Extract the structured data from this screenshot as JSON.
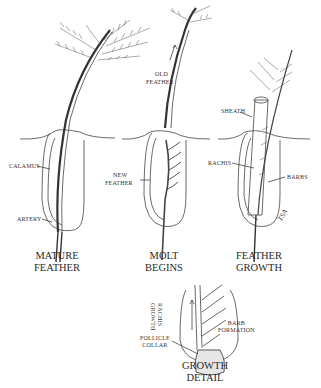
{
  "diagram": {
    "stages": [
      {
        "caption_line1": "MATURE",
        "caption_line2": "FEATHER"
      },
      {
        "caption_line1": "MOLT",
        "caption_line2": "BEGINS"
      },
      {
        "caption_line1": "FEATHER",
        "caption_line2": "GROWTH"
      },
      {
        "caption_line1": "GROWTH",
        "caption_line2": "DETAIL"
      }
    ],
    "labels": {
      "calamus": "CALAMUS",
      "artery": "ARTERY",
      "old_feather_1": "OLD",
      "old_feather_2": "FEATHER",
      "new_feather_1": "NEW",
      "new_feather_2": "FEATHER",
      "sheath": "SHEATH",
      "rachis": "RACHIS",
      "barbs": "BARBS",
      "rachis_growth_1": "RACHIS",
      "rachis_growth_2": "GROWTH",
      "follicle_collar_1": "FOLLICLE",
      "follicle_collar_2": "COLLAR",
      "barb_formation_1": "BARB",
      "barb_formation_2": "FORMATION"
    },
    "signature": "TSA"
  }
}
